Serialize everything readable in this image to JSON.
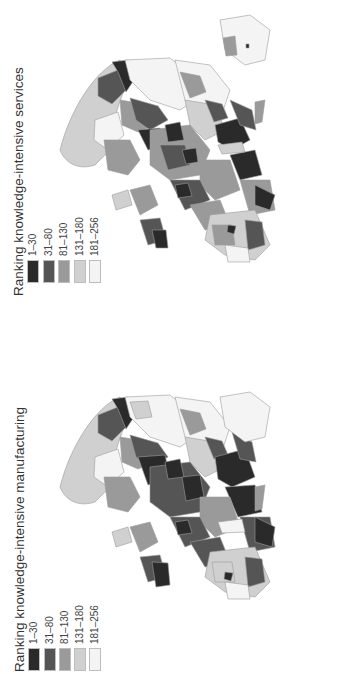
{
  "maps": [
    {
      "id": "services",
      "title": "Ranking knowledge-intensive services",
      "legend": [
        {
          "label": "1–30",
          "color": "#2a2a2a"
        },
        {
          "label": "31–80",
          "color": "#555555"
        },
        {
          "label": "81–130",
          "color": "#9a9a9a"
        },
        {
          "label": "131–180",
          "color": "#d0d0d0"
        },
        {
          "label": "181–256",
          "color": "#f4f4f4"
        }
      ]
    },
    {
      "id": "manufacturing",
      "title": "Ranking knowledge-intensive manufacturing",
      "legend": [
        {
          "label": "1–30",
          "color": "#2a2a2a"
        },
        {
          "label": "31–80",
          "color": "#555555"
        },
        {
          "label": "81–130",
          "color": "#9a9a9a"
        },
        {
          "label": "131–180",
          "color": "#d0d0d0"
        },
        {
          "label": "181–256",
          "color": "#f4f4f4"
        }
      ]
    }
  ],
  "orientation": "rotated 90° counter-clockwise"
}
